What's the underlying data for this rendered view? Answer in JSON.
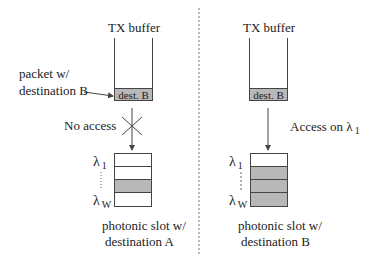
{
  "diagram": {
    "colors": {
      "line": "#444444",
      "fill": "#b8b8b8",
      "divider": "#bbbbbb"
    },
    "left": {
      "buffer_title": "TX buffer",
      "packet_label": "dest. B",
      "packet_annotation_line1": "packet w/",
      "packet_annotation_line2": "destination B",
      "transition_label": "No access",
      "transition_icon": "cross-icon",
      "slot_top_label": "λ",
      "slot_top_sub": "1",
      "slot_bottom_label": "λ",
      "slot_bottom_sub": "W",
      "slot_lanes": [
        "empty",
        "empty",
        "filled",
        "empty"
      ],
      "caption_line1": "photonic slot w/",
      "caption_line2": "destination A"
    },
    "right": {
      "buffer_title": "TX buffer",
      "packet_label": "dest. B",
      "transition_label": "Access on λ",
      "transition_sub": "1",
      "slot_top_label": "λ",
      "slot_top_sub": "1",
      "slot_bottom_label": "λ",
      "slot_bottom_sub": "W",
      "slot_lanes": [
        "empty",
        "filled",
        "filled",
        "filled"
      ],
      "caption_line1": "photonic slot w/",
      "caption_line2": "destination B"
    }
  }
}
